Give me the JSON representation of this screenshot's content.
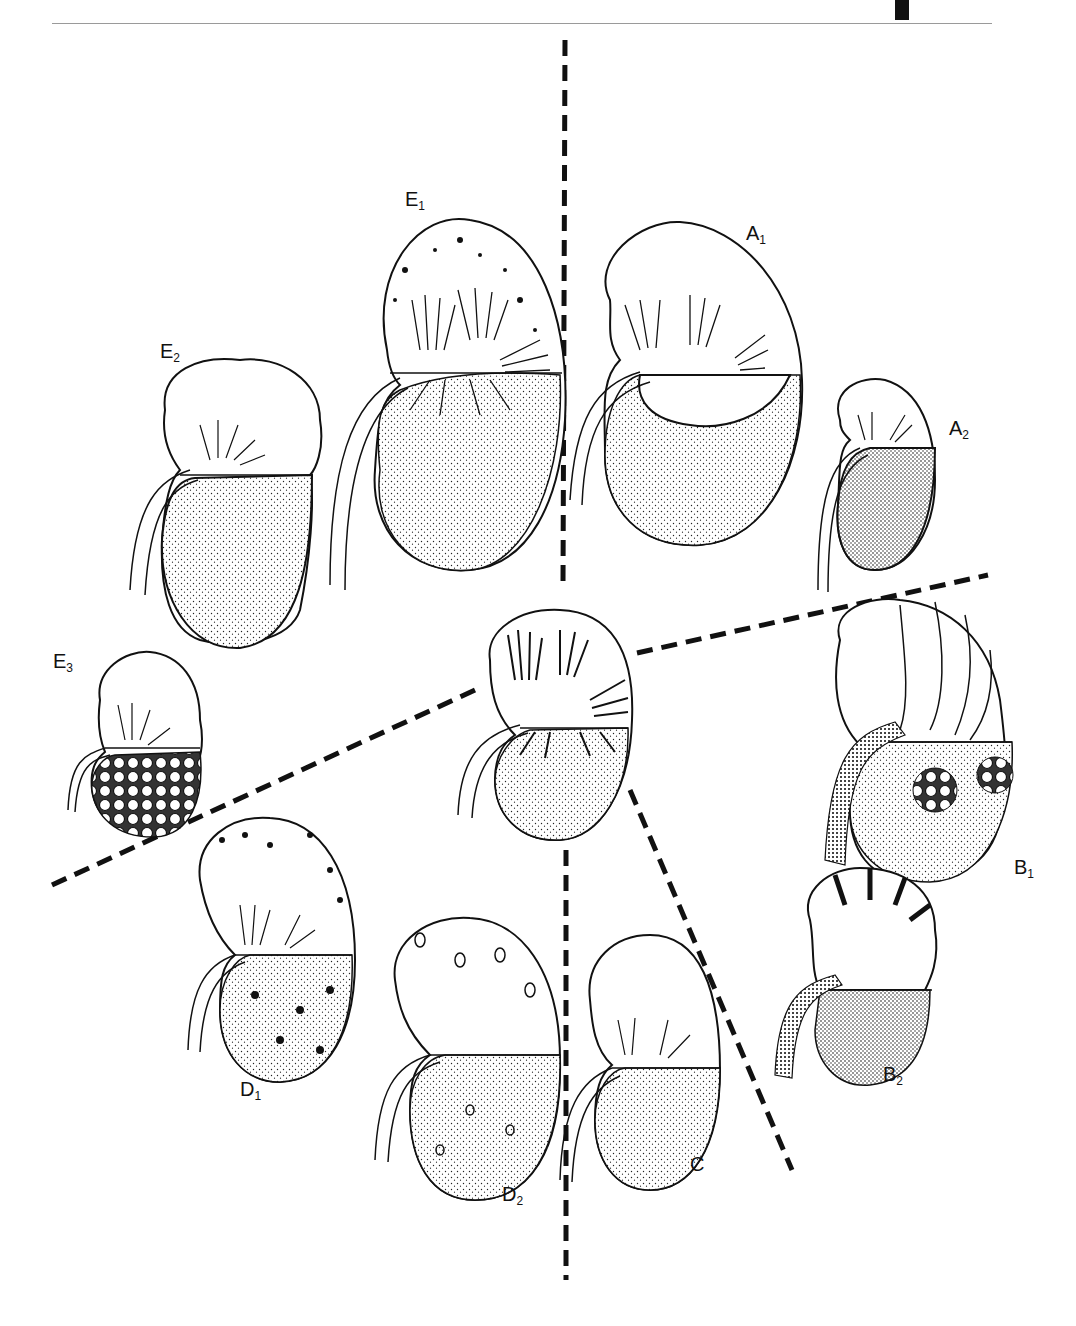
{
  "figure": {
    "center_kidney": "normal kidney (central, unlabeled)",
    "labels": [
      {
        "id": "A1",
        "base": "A",
        "sub": "1"
      },
      {
        "id": "A2",
        "base": "A",
        "sub": "2"
      },
      {
        "id": "B1",
        "base": "B",
        "sub": "1"
      },
      {
        "id": "B2",
        "base": "B",
        "sub": "2"
      },
      {
        "id": "C",
        "base": "C",
        "sub": ""
      },
      {
        "id": "D1",
        "base": "D",
        "sub": "1"
      },
      {
        "id": "D2",
        "base": "D",
        "sub": "2"
      },
      {
        "id": "E1",
        "base": "E",
        "sub": "1"
      },
      {
        "id": "E2",
        "base": "E",
        "sub": "2"
      },
      {
        "id": "E3",
        "base": "E",
        "sub": "3"
      }
    ],
    "dividers": 5
  }
}
